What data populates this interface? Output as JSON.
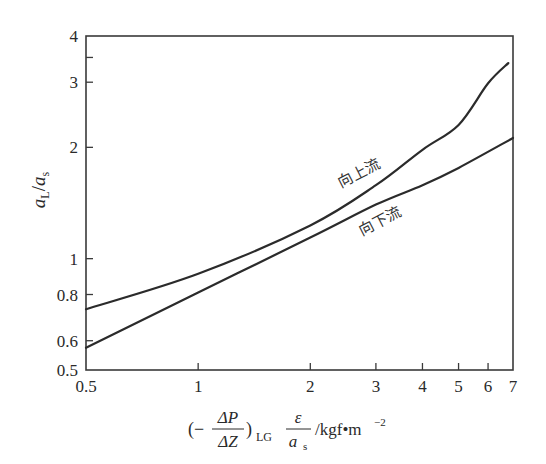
{
  "chart_data": {
    "type": "line",
    "title": "",
    "xlabel": "(-ΔP/ΔZ)_LG · ε/a_s /kgf·m^-2",
    "xlabel_parts": {
      "open_paren": "(−",
      "num": "ΔP",
      "den": "ΔZ",
      "close_paren": ")",
      "sub": "LG",
      "frac2_num": "ε",
      "frac2_den_main": "a",
      "frac2_den_sub": "s",
      "unit": "/kgf•m",
      "unit_sup": "−2"
    },
    "ylabel": "a_L/a_s",
    "ylabel_parts": {
      "a1": "a",
      "sub1": "L",
      "slash": "/",
      "a2": "a",
      "sub2": "s"
    },
    "xscale": "log",
    "yscale": "log",
    "xlim": [
      0.5,
      7
    ],
    "ylim": [
      0.5,
      4
    ],
    "xticks": [
      0.5,
      1,
      2,
      3,
      4,
      5,
      6,
      7
    ],
    "xtick_labels": [
      "0.5",
      "1",
      "2",
      "3",
      "4",
      "5",
      "6",
      "7"
    ],
    "yticks": [
      0.5,
      0.6,
      0.8,
      1,
      2,
      3,
      4
    ],
    "ytick_labels": [
      "0.5",
      "0.6",
      "0.8",
      "1",
      "2",
      "3",
      "4"
    ],
    "y_minor_ticks": [
      3.5
    ],
    "grid": false,
    "legend": "inline curve labels",
    "series": [
      {
        "name": "向上流",
        "x": [
          0.5,
          1,
          2,
          3,
          4,
          5,
          6,
          6.8
        ],
        "values": [
          0.73,
          0.91,
          1.23,
          1.58,
          1.97,
          2.3,
          2.98,
          3.38
        ]
      },
      {
        "name": "向下流",
        "x": [
          0.5,
          1,
          2,
          3,
          4,
          5,
          7
        ],
        "values": [
          0.574,
          0.81,
          1.14,
          1.4,
          1.58,
          1.76,
          2.12
        ]
      }
    ],
    "annotations": [
      {
        "text": "向上流",
        "near_x": 3,
        "near_y": 1.75
      },
      {
        "text": "向下流",
        "near_x": 3.6,
        "near_y": 1.3
      }
    ]
  },
  "colors": {
    "line": "#2b2b2b",
    "axis": "#3a3a3a",
    "background": "#ffffff"
  }
}
